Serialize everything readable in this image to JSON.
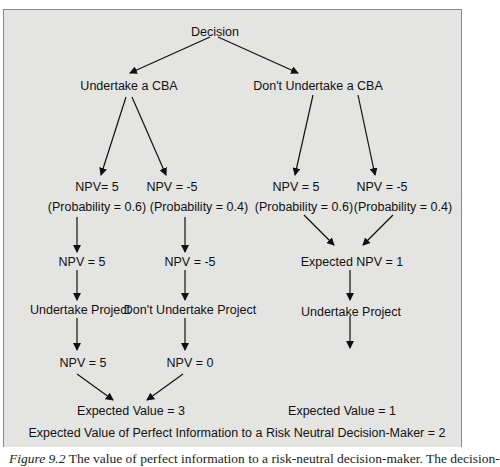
{
  "diagram": {
    "root": "Decision",
    "branch_left": "Undertake a CBA",
    "branch_right": "Don't Undertake a CBA",
    "left": {
      "outcome_a": {
        "npv": "NPV= 5",
        "prob": "(Probability = 0.6)",
        "npv2": "NPV = 5",
        "action": "Undertake Project",
        "result": "NPV = 5"
      },
      "outcome_b": {
        "npv": "NPV = -5",
        "prob": "(Probability = 0.4)",
        "npv2": "NPV = -5",
        "action": "Don't Undertake Project",
        "result": "NPV = 0"
      },
      "expected": "Expected Value = 3"
    },
    "right": {
      "outcome_a": {
        "npv": "NPV = 5",
        "prob": "(Probability = 0.6)"
      },
      "outcome_b": {
        "npv": "NPV = -5",
        "prob": "(Probability = 0.4)"
      },
      "expected_npv": "Expected NPV = 1",
      "action": "Undertake Project",
      "expected": "Expected Value = 1"
    },
    "summary": "Expected Value of Perfect Information to a Risk Neutral Decision-Maker = 2"
  },
  "caption": {
    "label": "Figure 9.2",
    "text": " The value of perfect information to a risk-neutral decision-maker. The decision-"
  }
}
